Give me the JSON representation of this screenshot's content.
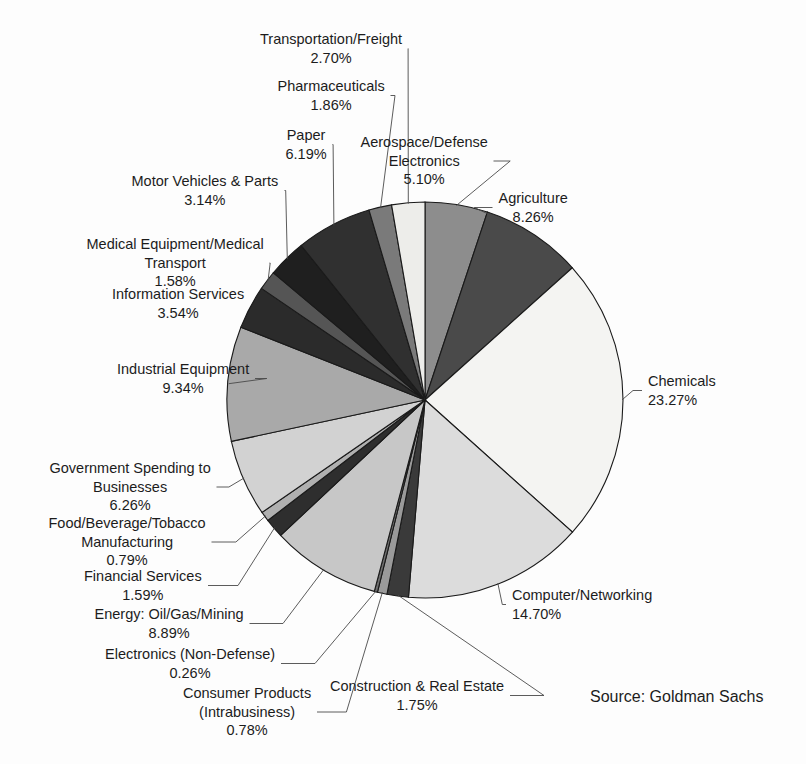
{
  "source_note": "Source: Goldman Sachs",
  "bottom_caption": "",
  "chart_data": {
    "type": "pie",
    "title": "",
    "subtitle": "",
    "xlabel": "",
    "ylabel": "",
    "legend_position": "none",
    "grid": false,
    "value_unit": "percent",
    "total": 100.0,
    "source": "Source: Goldman Sachs",
    "categories": [
      "Aerospace/Defense Electronics",
      "Agriculture",
      "Chemicals",
      "Computer/Networking",
      "Construction & Real Estate",
      "Consumer Products (Intrabusiness)",
      "Electronics (Non-Defense)",
      "Energy: Oil/Gas/Mining",
      "Financial Services",
      "Food/Beverage/Tobacco Manufacturing",
      "Government Spending to Businesses",
      "Industrial Equipment",
      "Information Services",
      "Medical Equipment/Medical Transport",
      "Motor Vehicles & Parts",
      "Paper",
      "Pharmaceuticals",
      "Transportation/Freight"
    ],
    "values": [
      5.1,
      8.26,
      23.27,
      14.7,
      1.75,
      0.78,
      0.26,
      8.89,
      1.59,
      0.79,
      6.26,
      9.34,
      3.54,
      1.58,
      3.14,
      6.19,
      1.86,
      2.7
    ],
    "slices": [
      {
        "label": "Aerospace/Defense Electronics",
        "label_lines": [
          "Aerospace/Defense",
          "Electronics"
        ],
        "percent_text": "5.10%",
        "value": 5.1,
        "fill": "#8d8d8d",
        "label_align": "center",
        "label_left": 424,
        "label_top": 133
      },
      {
        "label": "Agriculture",
        "label_lines": [
          "Agriculture"
        ],
        "percent_text": "8.26%",
        "value": 8.26,
        "fill": "#4a4a4a",
        "label_align": "center",
        "label_left": 533,
        "label_top": 189
      },
      {
        "label": "Chemicals",
        "label_lines": [
          "Chemicals"
        ],
        "percent_text": "23.27%",
        "value": 23.27,
        "fill": "#f4f4f2",
        "label_align": "left",
        "label_left": 648,
        "label_top": 372
      },
      {
        "label": "Computer/Networking",
        "label_lines": [
          "Computer/Networking"
        ],
        "percent_text": "14.70%",
        "value": 14.7,
        "fill": "#dcdcdc",
        "label_align": "left",
        "label_left": 512,
        "label_top": 586
      },
      {
        "label": "Construction & Real Estate",
        "label_lines": [
          "Construction & Real Estate"
        ],
        "percent_text": "1.75%",
        "value": 1.75,
        "fill": "#3a3a3a",
        "label_align": "center",
        "label_left": 417,
        "label_top": 677
      },
      {
        "label": "Consumer Products (Intrabusiness)",
        "label_lines": [
          "Consumer Products",
          "(Intrabusiness)"
        ],
        "percent_text": "0.78%",
        "value": 0.78,
        "fill": "#9a9a9a",
        "label_align": "center",
        "label_left": 247,
        "label_top": 684
      },
      {
        "label": "Electronics (Non-Defense)",
        "label_lines": [
          "Electronics (Non-Defense)"
        ],
        "percent_text": "0.26%",
        "value": 0.26,
        "fill": "#6e6e6e",
        "label_align": "center",
        "label_left": 190,
        "label_top": 645
      },
      {
        "label": "Energy: Oil/Gas/Mining",
        "label_lines": [
          "Energy: Oil/Gas/Mining"
        ],
        "percent_text": "8.89%",
        "value": 8.89,
        "fill": "#c7c7c7",
        "label_align": "center",
        "label_left": 169,
        "label_top": 605
      },
      {
        "label": "Financial Services",
        "label_lines": [
          "Financial Services"
        ],
        "percent_text": "1.59%",
        "value": 1.59,
        "fill": "#2e2e2e",
        "label_align": "center",
        "label_left": 143,
        "label_top": 567
      },
      {
        "label": "Food/Beverage/Tobacco Manufacturing",
        "label_lines": [
          "Food/Beverage/Tobacco",
          "Manufacturing"
        ],
        "percent_text": "0.79%",
        "value": 0.79,
        "fill": "#b0b0b0",
        "label_align": "center",
        "label_left": 127,
        "label_top": 514
      },
      {
        "label": "Government Spending to Businesses",
        "label_lines": [
          "Government Spending to",
          "Businesses"
        ],
        "percent_text": "6.26%",
        "value": 6.26,
        "fill": "#d2d2d2",
        "label_align": "center",
        "label_left": 130,
        "label_top": 459
      },
      {
        "label": "Industrial Equipment",
        "label_lines": [
          "Industrial Equipment"
        ],
        "percent_text": "9.34%",
        "value": 9.34,
        "fill": "#a9a9a9",
        "label_align": "center",
        "label_left": 183,
        "label_top": 360
      },
      {
        "label": "Information Services",
        "label_lines": [
          "Information Services"
        ],
        "percent_text": "3.54%",
        "value": 3.54,
        "fill": "#2b2b2b",
        "label_align": "center",
        "label_left": 178,
        "label_top": 285
      },
      {
        "label": "Medical Equipment/Medical Transport",
        "label_lines": [
          "Medical Equipment/Medical",
          "Transport"
        ],
        "percent_text": "1.58%",
        "value": 1.58,
        "fill": "#555555",
        "label_align": "center",
        "label_left": 175,
        "label_top": 235
      },
      {
        "label": "Motor Vehicles & Parts",
        "label_lines": [
          "Motor Vehicles & Parts"
        ],
        "percent_text": "3.14%",
        "value": 3.14,
        "fill": "#1f1f1f",
        "label_align": "center",
        "label_left": 205,
        "label_top": 172
      },
      {
        "label": "Paper",
        "label_lines": [
          "Paper"
        ],
        "percent_text": "6.19%",
        "value": 6.19,
        "fill": "#303030",
        "label_align": "center",
        "label_left": 306,
        "label_top": 126
      },
      {
        "label": "Pharmaceuticals",
        "label_lines": [
          "Pharmaceuticals"
        ],
        "percent_text": "1.86%",
        "value": 1.86,
        "fill": "#7a7a7a",
        "label_align": "center",
        "label_left": 331,
        "label_top": 77
      },
      {
        "label": "Transportation/Freight",
        "label_lines": [
          "Transportation/Freight"
        ],
        "percent_text": "2.70%",
        "value": 2.7,
        "fill": "#ededea",
        "label_align": "center",
        "label_left": 331,
        "label_top": 30
      }
    ],
    "geometry": {
      "center_x": 425,
      "center_y": 400,
      "radius": 198,
      "start_angle_deg": -90,
      "direction": "clockwise"
    }
  }
}
